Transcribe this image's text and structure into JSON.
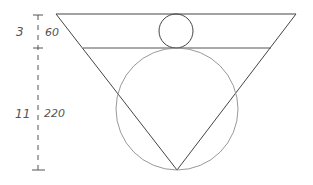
{
  "diagram": {
    "stroke_color": "#444444",
    "circle_color": "#888888",
    "labels": {
      "top_ratio": "3",
      "top_height": "60",
      "bottom_ratio": "11",
      "bottom_height": "220"
    },
    "shapes": {
      "triangle": {
        "points": [
          [
            56,
            14
          ],
          [
            296,
            14
          ],
          [
            177,
            170
          ]
        ]
      },
      "top_line_y": 14,
      "mid_line": {
        "x1": 83,
        "x2": 271,
        "y": 48
      },
      "small_circle": {
        "cx": 176,
        "cy": 31,
        "r": 17
      },
      "large_circle": {
        "cx": 177,
        "cy": 109,
        "r": 61
      },
      "dimension_line": {
        "x": 38,
        "ticks_y": [
          15,
          48,
          170
        ]
      }
    }
  }
}
